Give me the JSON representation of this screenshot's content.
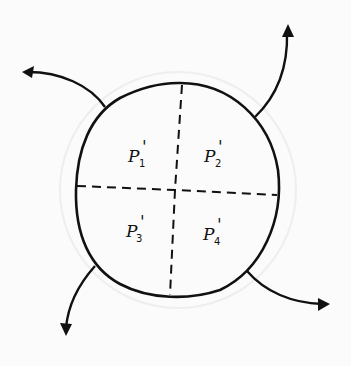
{
  "diagram": {
    "regions": [
      {
        "label": "P",
        "prime": "'",
        "sub": "1"
      },
      {
        "label": "P",
        "prime": "'",
        "sub": "2"
      },
      {
        "label": "P",
        "prime": "'",
        "sub": "3"
      },
      {
        "label": "P",
        "prime": "'",
        "sub": "4"
      }
    ],
    "arrows": [
      "top-left-outward",
      "top-right-outward",
      "bottom-left-outward",
      "bottom-right-outward"
    ],
    "colors": {
      "ink": "#111111",
      "paper": "#fbfbfb"
    }
  }
}
